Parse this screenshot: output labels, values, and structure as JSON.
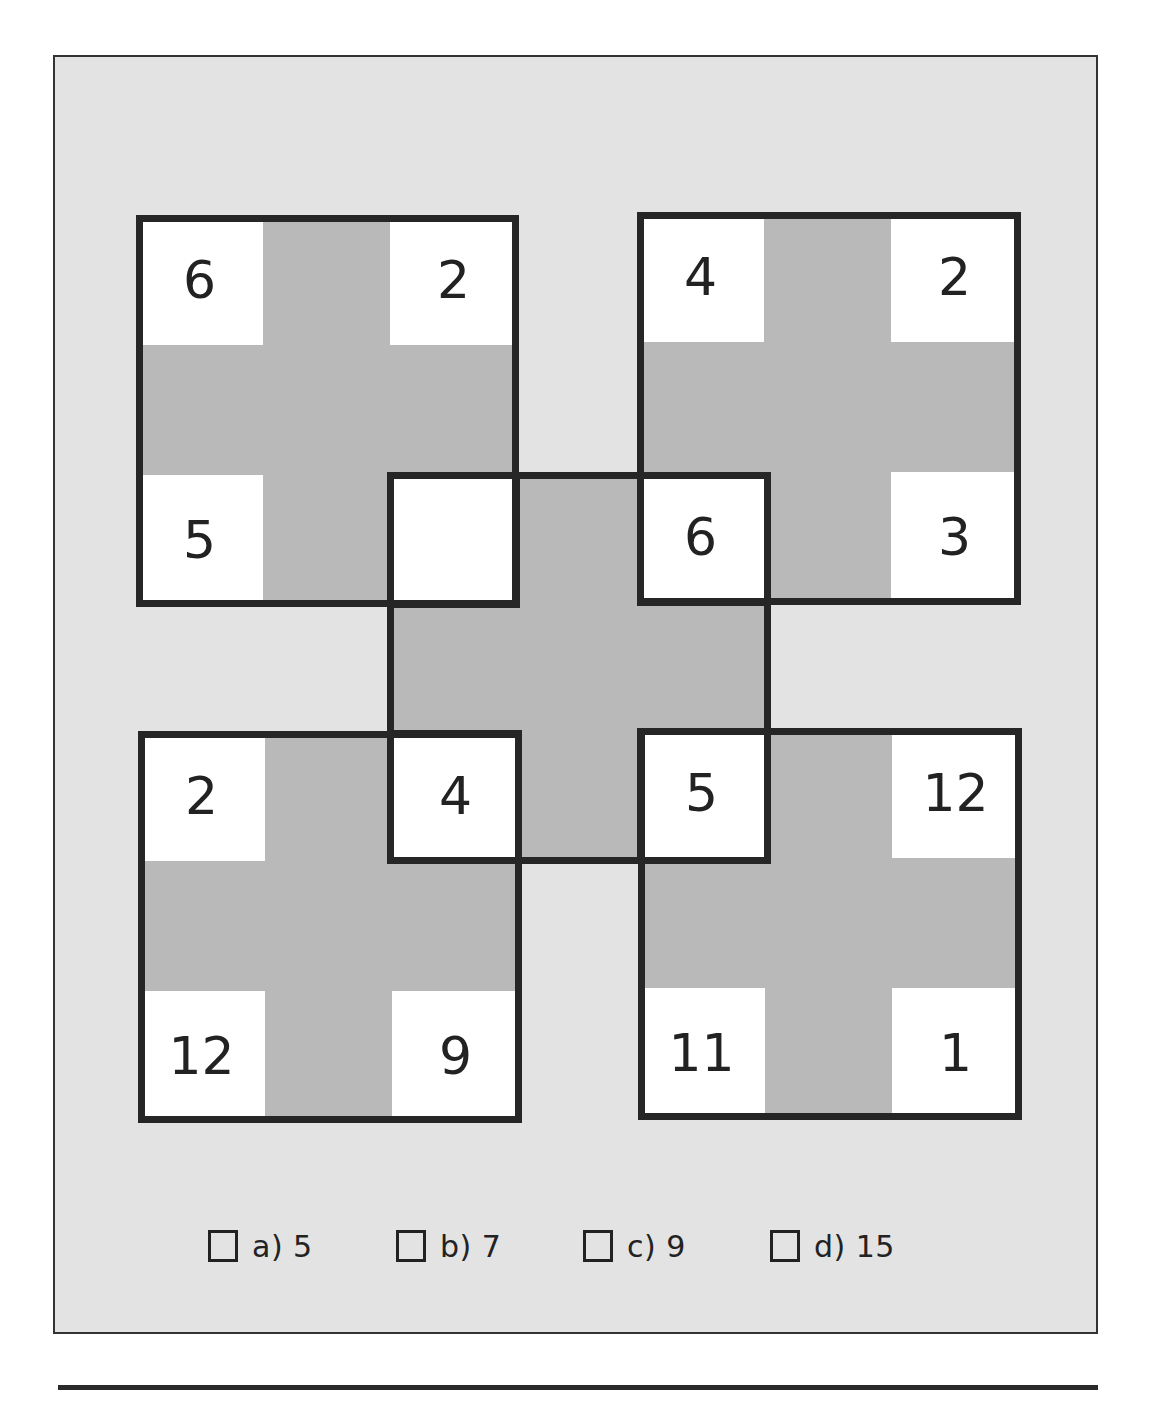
{
  "puzzle": {
    "type": "number-grid-overlapping-squares",
    "colors": {
      "background": "#e3e3e3",
      "cell_white": "#ffffff",
      "cell_grey": "#b9b9b9",
      "border": "#262626",
      "text": "#222222"
    },
    "squares": {
      "top_left": {
        "tl": "6",
        "tr": "2",
        "bl": "5",
        "br": ""
      },
      "top_right": {
        "tl": "4",
        "tr": "2",
        "bl": "6",
        "br": "3"
      },
      "bottom_left": {
        "tl": "2",
        "tr": "4",
        "bl": "12",
        "br": "9"
      },
      "bottom_right": {
        "tl": "5",
        "tr": "12",
        "bl": "11",
        "br": "1"
      },
      "center": {
        "tl": "",
        "tr": "6",
        "bl": "4",
        "br": "5"
      }
    },
    "missing_cell": "top_left.br"
  },
  "options": [
    {
      "label": "a) 5"
    },
    {
      "label": "b) 7"
    },
    {
      "label": "c) 9"
    },
    {
      "label": "d) 15"
    }
  ]
}
